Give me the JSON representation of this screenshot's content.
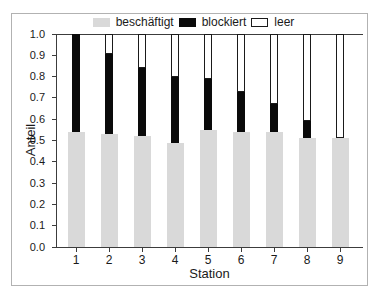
{
  "legend": [
    {
      "label": "beschäftigt",
      "color": "#d9d9d9",
      "border": "#d9d9d9"
    },
    {
      "label": "blockiert",
      "color": "#0a0a0a",
      "border": "#0a0a0a"
    },
    {
      "label": "leer",
      "color": "#ffffff",
      "border": "#1a1a1a"
    }
  ],
  "chart_data": {
    "type": "bar",
    "stacked": true,
    "title": "",
    "xlabel": "Station",
    "ylabel": "Anteil",
    "categories": [
      "1",
      "2",
      "3",
      "4",
      "5",
      "6",
      "7",
      "8",
      "9"
    ],
    "series": [
      {
        "name": "beschäftigt",
        "color": "#d9d9d9",
        "border": null,
        "values": [
          0.54,
          0.53,
          0.52,
          0.49,
          0.55,
          0.54,
          0.54,
          0.51,
          0.51
        ]
      },
      {
        "name": "blockiert",
        "color": "#0a0a0a",
        "border": null,
        "values": [
          0.46,
          0.375,
          0.32,
          0.31,
          0.24,
          0.19,
          0.13,
          0.08,
          0.0
        ]
      },
      {
        "name": "leer",
        "color": "#ffffff",
        "border": "#1a1a1a",
        "values": [
          0.0,
          0.095,
          0.16,
          0.2,
          0.21,
          0.27,
          0.33,
          0.41,
          0.49
        ]
      }
    ],
    "ylim": [
      0.0,
      1.0
    ],
    "yticks": [
      0.0,
      0.1,
      0.2,
      0.3,
      0.4,
      0.5,
      0.6,
      0.7,
      0.8,
      0.9,
      1.0
    ],
    "ytick_labels": [
      "0.0",
      "0.1",
      "0.2",
      "0.3",
      "0.4",
      "0.5",
      "0.6",
      "0.7",
      "0.8",
      "0.9",
      "1.0"
    ],
    "grid": false,
    "legend_position": "top"
  },
  "colors": {
    "axis": "#3c3c3c",
    "frame_border": "#b2b2b2",
    "background": "#ffffff",
    "text": "#1a1a1a"
  }
}
